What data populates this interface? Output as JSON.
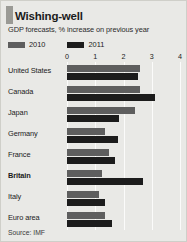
{
  "card": {
    "title": "Wishing-well",
    "subtitle": "GDP forecasts, % increase on previous year",
    "source": "Source: IMF",
    "background_color": "#e9e9e6",
    "accent_color": "#9a9a95"
  },
  "legend": {
    "items": [
      {
        "label": "2010",
        "color": "#5e5e5e"
      },
      {
        "label": "2011",
        "color": "#1c1c1c"
      }
    ]
  },
  "chart_data": {
    "type": "bar",
    "orientation": "horizontal",
    "title": "Wishing-well",
    "subtitle": "GDP forecasts, % increase on previous year",
    "xlabel": "",
    "ylabel": "",
    "xlim": [
      0,
      4
    ],
    "ticks": [
      0,
      1,
      2,
      3,
      4
    ],
    "tick_labels": [
      "0",
      "1",
      "2",
      "3",
      "4"
    ],
    "grid": true,
    "legend_position": "top-left",
    "source": "Source: IMF",
    "categories": [
      "United States",
      "Canada",
      "Japan",
      "Germany",
      "France",
      "Britain",
      "Italy",
      "Euro area"
    ],
    "highlighted_category": "Britain",
    "series": [
      {
        "name": "2010",
        "color": "#5e5e5e",
        "values": [
          2.6,
          2.6,
          2.4,
          1.35,
          1.5,
          1.25,
          1.15,
          1.35
        ]
      },
      {
        "name": "2011",
        "color": "#1c1c1c",
        "values": [
          2.5,
          3.1,
          1.85,
          1.8,
          1.7,
          2.7,
          1.35,
          1.6
        ]
      }
    ]
  }
}
